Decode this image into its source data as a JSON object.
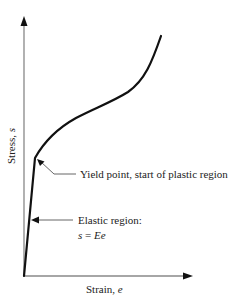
{
  "diagram": {
    "type": "stress-strain curve",
    "axes": {
      "x_label": "Strain, ",
      "x_var": "e",
      "y_label": "Stress, ",
      "y_var": "s"
    },
    "annotations": {
      "yield": "Yield point, start of plastic region",
      "elastic_title": "Elastic region:",
      "elastic_eq_lhs": "s",
      "elastic_eq_mid": " = ",
      "elastic_eq_rhs": "Ee"
    },
    "colors": {
      "curve": "#111111",
      "axis": "#777777",
      "text": "#222222",
      "leader": "#555555"
    }
  }
}
